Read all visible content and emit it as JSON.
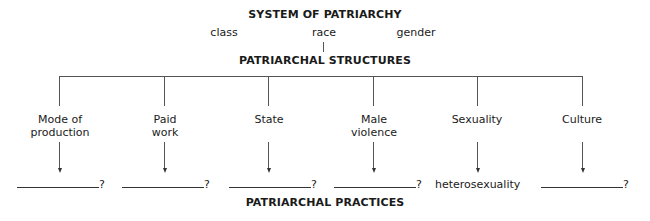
{
  "diagram": {
    "title": "SYSTEM OF PATRIARCHY",
    "dimensions": [
      {
        "label": "class"
      },
      {
        "label": "race"
      },
      {
        "label": "gender"
      }
    ],
    "structures_heading": "PATRIARCHAL STRUCTURES",
    "structures": [
      {
        "line1": "Mode of",
        "line2": "production",
        "practice": "",
        "suffix": "?"
      },
      {
        "line1": "Paid",
        "line2": "work",
        "practice": "",
        "suffix": "?"
      },
      {
        "line1": "State",
        "line2": "",
        "practice": "",
        "suffix": "?"
      },
      {
        "line1": "Male",
        "line2": "violence",
        "practice": "",
        "suffix": "?"
      },
      {
        "line1": "Sexuality",
        "line2": "",
        "practice": "heterosexuality",
        "suffix": ""
      },
      {
        "line1": "Culture",
        "line2": "",
        "practice": "",
        "suffix": "?"
      }
    ],
    "practices_heading": "PATRIARCHAL PRACTICES"
  }
}
